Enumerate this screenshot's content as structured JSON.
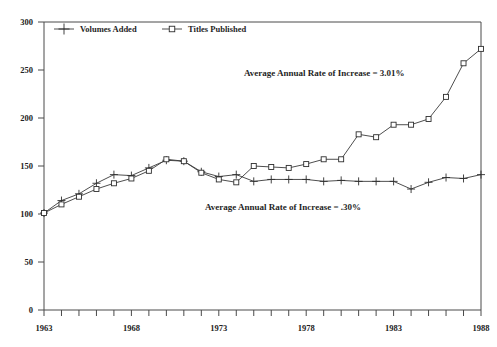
{
  "chart_data": {
    "type": "line",
    "title": "",
    "xlabel": "",
    "ylabel": "",
    "xlim": [
      1963,
      1988
    ],
    "ylim": [
      0,
      300
    ],
    "ytick_step": 50,
    "yticks": [
      0,
      50,
      100,
      150,
      200,
      250,
      300
    ],
    "ytick_labels": [
      "0",
      "50",
      "100",
      "150",
      "200",
      "250",
      "300"
    ],
    "xticks": [
      1963,
      1964,
      1965,
      1966,
      1967,
      1968,
      1969,
      1970,
      1971,
      1972,
      1973,
      1974,
      1975,
      1976,
      1977,
      1978,
      1979,
      1980,
      1981,
      1982,
      1983,
      1984,
      1985,
      1986,
      1987,
      1988
    ],
    "xtick_labels_shown": [
      "1963",
      "1968",
      "1973",
      "1978",
      "1983",
      "1988"
    ],
    "xtick_label_years": [
      1963,
      1968,
      1973,
      1978,
      1983,
      1988
    ],
    "grid": false,
    "legend_position": "top-inside",
    "x": [
      1963,
      1964,
      1965,
      1966,
      1967,
      1968,
      1969,
      1970,
      1971,
      1972,
      1973,
      1974,
      1975,
      1976,
      1977,
      1978,
      1979,
      1980,
      1981,
      1982,
      1983,
      1984,
      1985,
      1986,
      1987,
      1988
    ],
    "series": [
      {
        "name": "Volumes Added",
        "marker": "plus",
        "values": [
          101,
          114,
          121,
          132,
          141,
          140,
          148,
          156,
          155,
          144,
          139,
          141,
          134,
          136,
          136,
          136,
          134,
          135,
          134,
          134,
          134,
          126,
          133,
          138,
          137,
          141
        ]
      },
      {
        "name": "Titles Published",
        "marker": "square",
        "values": [
          101,
          110,
          118,
          126,
          132,
          137,
          145,
          157,
          155,
          143,
          136,
          133,
          150,
          149,
          148,
          152,
          157,
          157,
          183,
          180,
          193,
          193,
          199,
          222,
          257,
          272
        ]
      }
    ],
    "annotations": [
      {
        "text": "Average Annual Rate of Increase = 3.01%",
        "x_px": 244,
        "y_px": 76
      },
      {
        "text": "Average Annual Rate of Increase = .30%",
        "x_px": 205,
        "y_px": 210
      }
    ],
    "legend": [
      {
        "label": "Volumes Added",
        "marker": "plus"
      },
      {
        "label": "Titles Published",
        "marker": "square"
      }
    ],
    "colors": {
      "line": "#3a3a3a",
      "marker_stroke": "#2e2e2e",
      "marker_fill": "#ffffff",
      "axis": "#4a4a4a",
      "text": "#1f1f1f",
      "background": "#ffffff"
    }
  }
}
